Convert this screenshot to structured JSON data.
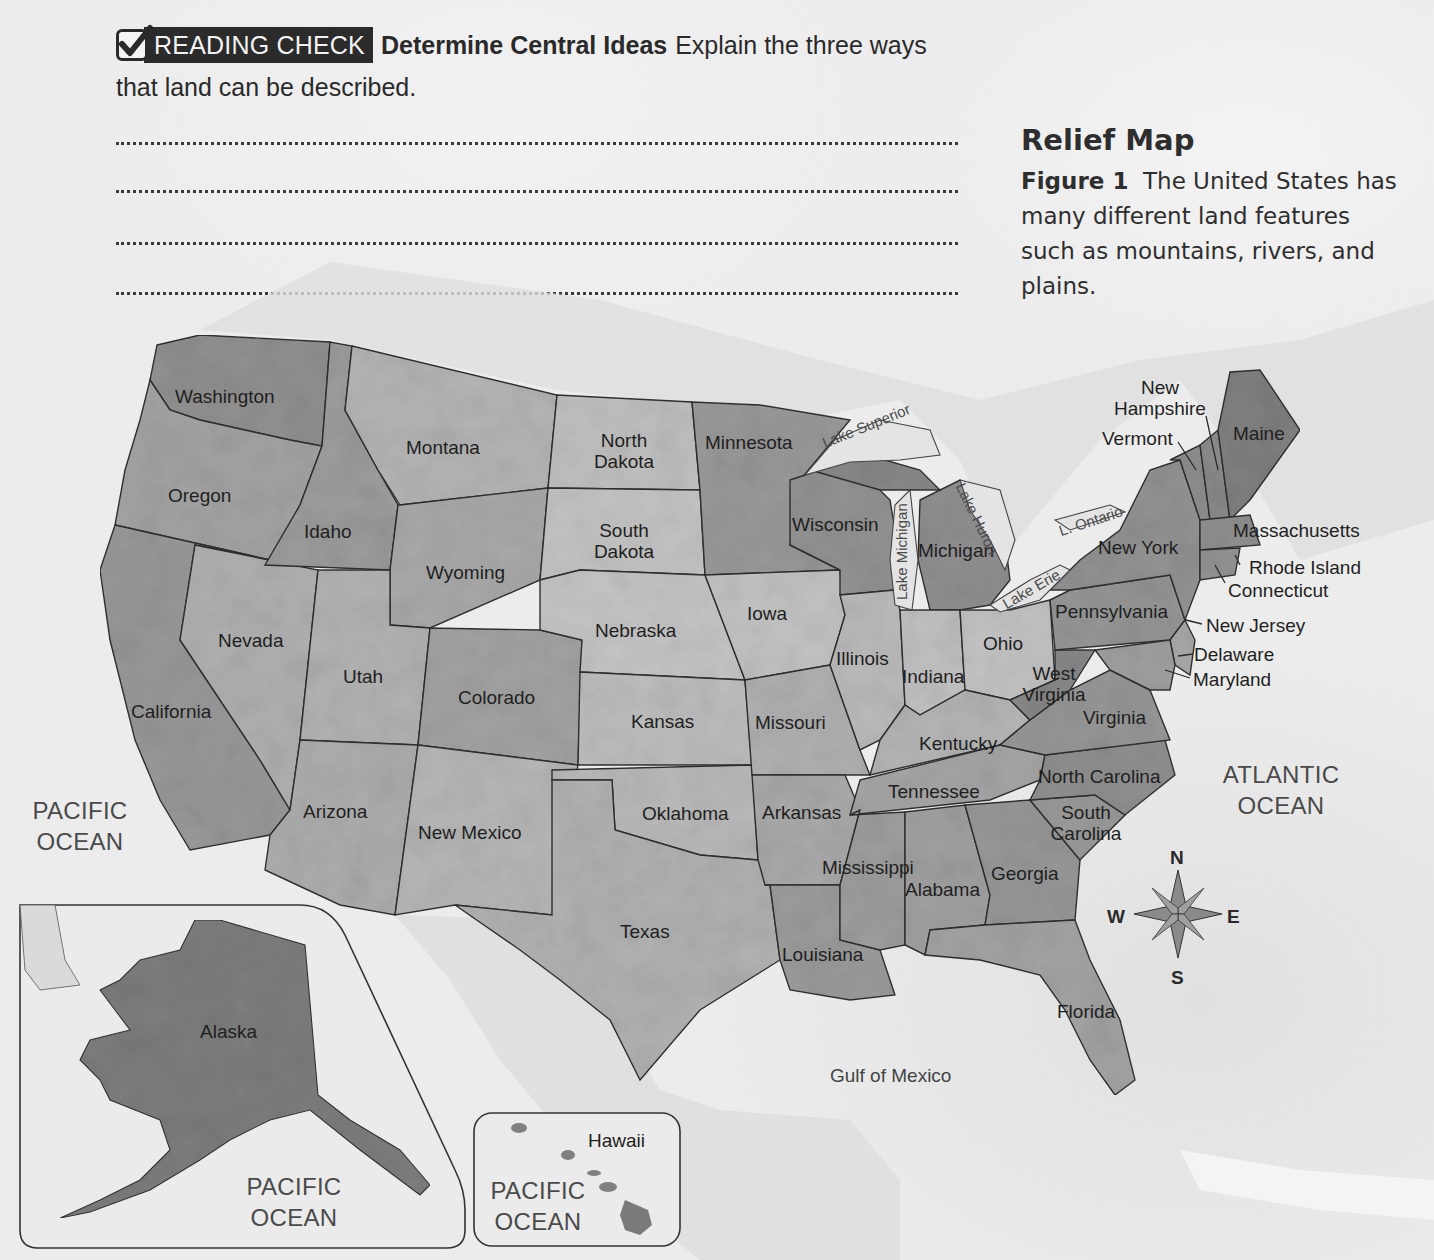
{
  "reading_check": {
    "badge_label": "READING CHECK",
    "skill": "Determine Central Ideas",
    "prompt": "Explain the three ways that land can be described.",
    "answer_lines": 4
  },
  "figure": {
    "title": "Relief Map",
    "label": "Figure 1",
    "caption": "The United States has many different land features such as mountains, rivers, and plains."
  },
  "map": {
    "states": [
      {
        "name": "Washington"
      },
      {
        "name": "Oregon"
      },
      {
        "name": "Idaho"
      },
      {
        "name": "Montana"
      },
      {
        "name": "Wyoming"
      },
      {
        "name": "Nevada"
      },
      {
        "name": "Utah"
      },
      {
        "name": "California"
      },
      {
        "name": "Colorado"
      },
      {
        "name": "Arizona"
      },
      {
        "name": "New Mexico"
      },
      {
        "name": "North Dakota"
      },
      {
        "name": "South Dakota"
      },
      {
        "name": "Nebraska"
      },
      {
        "name": "Kansas"
      },
      {
        "name": "Oklahoma"
      },
      {
        "name": "Texas"
      },
      {
        "name": "Minnesota"
      },
      {
        "name": "Iowa"
      },
      {
        "name": "Missouri"
      },
      {
        "name": "Arkansas"
      },
      {
        "name": "Louisiana"
      },
      {
        "name": "Wisconsin"
      },
      {
        "name": "Illinois"
      },
      {
        "name": "Michigan"
      },
      {
        "name": "Indiana"
      },
      {
        "name": "Ohio"
      },
      {
        "name": "Kentucky"
      },
      {
        "name": "Tennessee"
      },
      {
        "name": "Mississippi"
      },
      {
        "name": "Alabama"
      },
      {
        "name": "Georgia"
      },
      {
        "name": "Florida"
      },
      {
        "name": "South Carolina"
      },
      {
        "name": "North Carolina"
      },
      {
        "name": "Virginia"
      },
      {
        "name": "West Virginia"
      },
      {
        "name": "Pennsylvania"
      },
      {
        "name": "New York"
      },
      {
        "name": "Vermont"
      },
      {
        "name": "New Hampshire"
      },
      {
        "name": "Maine"
      },
      {
        "name": "Massachusetts"
      },
      {
        "name": "Rhode Island"
      },
      {
        "name": "Connecticut"
      },
      {
        "name": "New Jersey"
      },
      {
        "name": "Delaware"
      },
      {
        "name": "Maryland"
      },
      {
        "name": "Alaska"
      },
      {
        "name": "Hawaii"
      }
    ],
    "lakes": [
      "Lake Superior",
      "Lake Michigan",
      "Lake Huron",
      "Lake Erie",
      "L. Ontario"
    ],
    "water": {
      "pacific_main": "PACIFIC OCEAN",
      "pacific_alaska": "PACIFIC OCEAN",
      "pacific_hawaii": "PACIFIC OCEAN",
      "atlantic": "ATLANTIC OCEAN",
      "gulf": "Gulf of Mexico"
    },
    "compass": {
      "n": "N",
      "s": "S",
      "e": "E",
      "w": "W"
    },
    "colors": {
      "land_light": "#bdbdbd",
      "land_mid": "#9a9a9a",
      "land_dark": "#7c7c7c",
      "water": "#e6e6e6",
      "border": "#333333"
    }
  }
}
